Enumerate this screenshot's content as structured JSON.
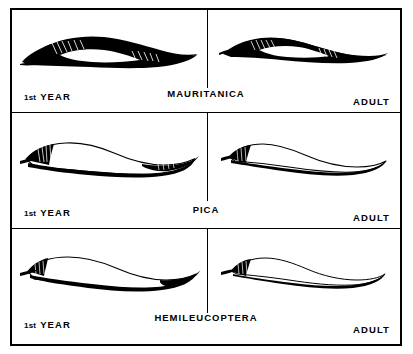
{
  "plate": {
    "title_present": false,
    "columns": 2,
    "rows": 3,
    "border_color": "#000000",
    "background_color": "#ffffff",
    "ink_color": "#000000"
  },
  "labels": {
    "stage_first_year_ordinal": "1st",
    "stage_first_year_word": "YEAR",
    "stage_adult": "ADULT"
  },
  "rows": [
    {
      "species": "MAURITANICA",
      "left": {
        "stage": "1st YEAR",
        "specimen": "feather-profile-mauritanica-first-year",
        "fill": "solid-black",
        "description": "broad heavily pigmented profile with small pale window and fine hatching"
      },
      "right": {
        "stage": "ADULT",
        "specimen": "feather-profile-mauritanica-adult",
        "fill": "solid-black",
        "description": "slender heavily pigmented profile with small pale window and fine hatching"
      }
    },
    {
      "species": "PICA",
      "left": {
        "stage": "1st YEAR",
        "specimen": "feather-profile-pica-first-year",
        "fill": "outline-pale",
        "description": "broad pale profile with dark margins and hatched base"
      },
      "right": {
        "stage": "ADULT",
        "specimen": "feather-profile-pica-adult",
        "fill": "outline-pale",
        "description": "slender pale profile with dark lower margin and dark base"
      }
    },
    {
      "species": "HEMILEUCOPTERA",
      "left": {
        "stage": "1st YEAR",
        "specimen": "feather-profile-hemileucoptera-first-year",
        "fill": "outline-pale",
        "description": "broad pale profile with thin dark margin and dark tip"
      },
      "right": {
        "stage": "ADULT",
        "specimen": "feather-profile-hemileucoptera-adult",
        "fill": "outline-pale",
        "description": "slender pale profile with thin dark margin and dark base"
      }
    }
  ]
}
